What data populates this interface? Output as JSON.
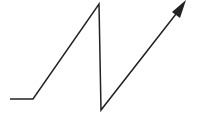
{
  "diagram": {
    "type": "arrow-path",
    "stroke_color": "#222222",
    "background": "#ffffff",
    "stroke_width": 1.5,
    "points": "10,99 33,99 99,4 101,110 176,14",
    "arrowhead": "186,0 172,12 180,18"
  }
}
